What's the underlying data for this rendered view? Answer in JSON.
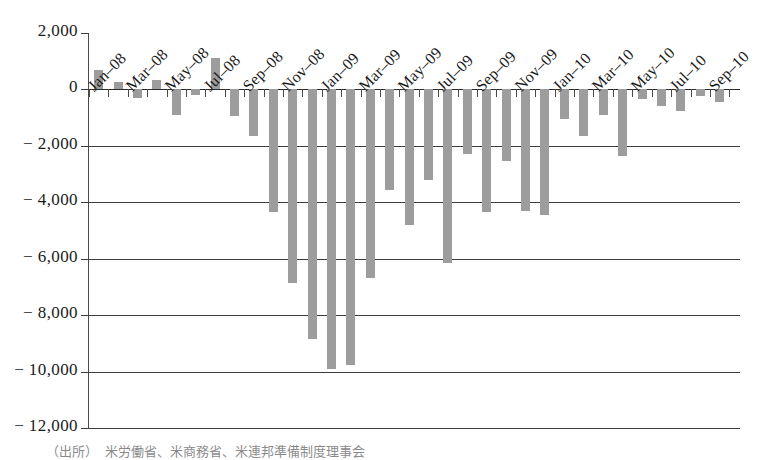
{
  "chart_data": {
    "type": "bar",
    "title": "",
    "xlabel": "",
    "ylabel": "",
    "ylim": [
      -12000,
      2000
    ],
    "ytick_step": 2000,
    "grid": true,
    "legend": null,
    "bar_color": "#9d9d9d",
    "axis_color": "#3d3d3d",
    "ytick_labels": [
      "2,000",
      "0",
      "− 2,000",
      "− 4,000",
      "− 6,000",
      "− 8,000",
      "− 10,000",
      "− 12,000"
    ],
    "yticks": [
      2000,
      0,
      -2000,
      -4000,
      -6000,
      -8000,
      -10000,
      -12000
    ],
    "xtick_labels": [
      "Jan–08",
      "Mar–08",
      "May–08",
      "Jul–08",
      "Sep–08",
      "Nov–08",
      "Jan–09",
      "Mar–09",
      "May–09",
      "Jul–09",
      "Sep–09",
      "Nov–09",
      "Jan–10",
      "Mar–10",
      "May–10",
      "Jul–10",
      "Sep–10"
    ],
    "categories": [
      "Jan–08",
      "Feb–08",
      "Mar–08",
      "Apr–08",
      "May–08",
      "Jun–08",
      "Jul–08",
      "Aug–08",
      "Sep–08",
      "Oct–08",
      "Nov–08",
      "Dec–08",
      "Jan–09",
      "Feb–09",
      "Mar–09",
      "Apr–09",
      "May–09",
      "Jun–09",
      "Jul–09",
      "Aug–09",
      "Sep–09",
      "Oct–09",
      "Nov–09",
      "Dec–09",
      "Jan–10",
      "Feb–10",
      "Mar–10",
      "Apr–10",
      "May–10",
      "Jun–10",
      "Jul–10",
      "Aug–10",
      "Sep–10"
    ],
    "values": [
      700,
      250,
      -300,
      350,
      -900,
      -200,
      1100,
      -950,
      -1650,
      -4350,
      -6850,
      -8850,
      -9900,
      -9750,
      -6700,
      -3550,
      -4800,
      -3200,
      -6150,
      -2300,
      -4350,
      -2550,
      -4300,
      -4450,
      -1050,
      -1650,
      -900,
      -2350,
      -350,
      -600,
      -750,
      -250,
      -450
    ]
  },
  "footer": {
    "source_note": "（出所）　米労働省、米商務省、米連邦準備制度理事会"
  }
}
